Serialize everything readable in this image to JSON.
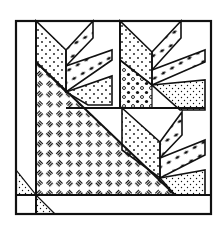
{
  "figure": {
    "colors": {
      "background": "#ffffff",
      "ink": "#111111"
    },
    "patterns": [
      "dots",
      "fine-dots",
      "circles",
      "diamonds",
      "dashes-weave"
    ]
  }
}
